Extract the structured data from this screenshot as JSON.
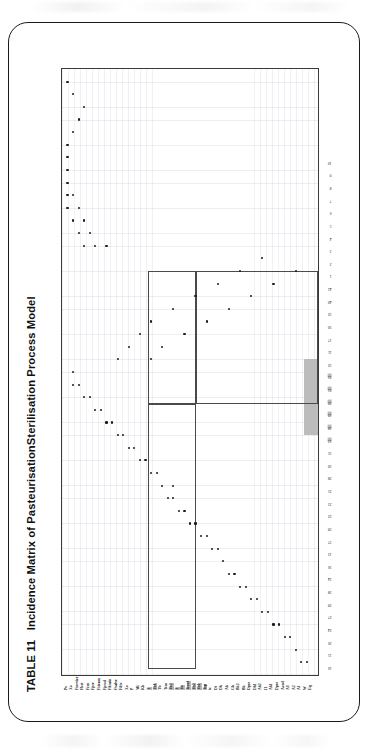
{
  "page": {
    "background": "#ffffff",
    "card_border_color": "#1a1a1a"
  },
  "caption": {
    "table_number": "TABLE 11",
    "title": "Incidence Matrix of PasteurisationSterilisation Process Model",
    "full": "TABLE 11  Incidence Matrix of PasteurisationSterilisation Process Model"
  },
  "highlight": {
    "color": "#b9b9b9",
    "row_label_range": [
      "Tsp",
      "Tb1",
      "Tb2",
      "Tcool",
      "Th",
      "T",
      "Th2"
    ],
    "col_label_range": [
      "18",
      "19",
      "20",
      "21",
      "31",
      "32"
    ]
  },
  "chart_data": {
    "type": "scatter",
    "title": "Incidence Matrix of PasteurisationSterilisation Process Model",
    "subtitle": "",
    "xlabel": "",
    "ylabel": "",
    "grid": true,
    "legend": "none",
    "orientation": "rotated-90-ccw",
    "xlim": [
      0,
      48
    ],
    "ylim": [
      0,
      46
    ],
    "x_tick_labels": [
      "16",
      "15",
      "26",
      "24",
      "27",
      "29",
      "38",
      "34",
      "36",
      "12",
      "37",
      "39",
      "22",
      "23",
      "25",
      "28",
      "30",
      "35",
      "13",
      "18",
      "19",
      "20",
      "21",
      "31",
      "32",
      "11",
      "17",
      "30",
      "32",
      "40",
      "41",
      "1",
      "2",
      "3",
      "4",
      "5",
      "6",
      "7",
      "8",
      "9",
      "10"
    ],
    "y_tick_labels": [
      "Eq",
      "W",
      "A1",
      "A2",
      "A3",
      "Acool",
      "Dpre",
      "Ah1",
      "I1",
      "Ah2",
      "Dh1",
      "Dpre",
      "Bh",
      "Bh2",
      "Gh",
      "Ah",
      "Dh",
      "Dt",
      "tc",
      "Tsp",
      "Tb1",
      "Tb2",
      "Tcool",
      "Th",
      "T",
      "Th2",
      "Tcm",
      "Tb",
      "Tb1",
      "T",
      "Kh",
      "Mi",
      "P",
      "Xo",
      "Fdiv",
      "Fvalve",
      "Fdrain",
      "Fprod",
      "Fsteam",
      "Fpre",
      "Fcm",
      "Fhot",
      "Fservice",
      "Xo",
      "Po"
    ],
    "points": [
      [
        1,
        2
      ],
      [
        1,
        3
      ],
      [
        2,
        4
      ],
      [
        3,
        5
      ],
      [
        3,
        6
      ],
      [
        4,
        7
      ],
      [
        4,
        8
      ],
      [
        5,
        9
      ],
      [
        5,
        10
      ],
      [
        6,
        11
      ],
      [
        6,
        12
      ],
      [
        7,
        13
      ],
      [
        7,
        14
      ],
      [
        8,
        15
      ],
      [
        8,
        16
      ],
      [
        9,
        17
      ],
      [
        10,
        18
      ],
      [
        10,
        19
      ],
      [
        11,
        20
      ],
      [
        11,
        21
      ],
      [
        12,
        22
      ],
      [
        12,
        23
      ],
      [
        13,
        24
      ],
      [
        13,
        25
      ],
      [
        14,
        26
      ],
      [
        14,
        27
      ],
      [
        15,
        26
      ],
      [
        15,
        28
      ],
      [
        16,
        29
      ],
      [
        16,
        30
      ],
      [
        17,
        31
      ],
      [
        17,
        32
      ],
      [
        18,
        33
      ],
      [
        18,
        34
      ],
      [
        19,
        35
      ],
      [
        19,
        36
      ],
      [
        20,
        37
      ],
      [
        20,
        38
      ],
      [
        21,
        39
      ],
      [
        21,
        40
      ],
      [
        22,
        41
      ],
      [
        22,
        42
      ],
      [
        23,
        43
      ],
      [
        23,
        44
      ],
      [
        24,
        44
      ],
      [
        25,
        30
      ],
      [
        25,
        36
      ],
      [
        26,
        28
      ],
      [
        26,
        34
      ],
      [
        27,
        24
      ],
      [
        27,
        32
      ],
      [
        28,
        20
      ],
      [
        28,
        30
      ],
      [
        29,
        16
      ],
      [
        29,
        26
      ],
      [
        30,
        12
      ],
      [
        30,
        22
      ],
      [
        31,
        8
      ],
      [
        31,
        18
      ],
      [
        32,
        4
      ],
      [
        32,
        14
      ],
      [
        33,
        10
      ],
      [
        34,
        38
      ],
      [
        34,
        40
      ],
      [
        34,
        42
      ],
      [
        35,
        41
      ],
      [
        35,
        43
      ],
      [
        36,
        42
      ],
      [
        36,
        44
      ],
      [
        37,
        43
      ],
      [
        37,
        45
      ],
      [
        38,
        44
      ],
      [
        38,
        45
      ],
      [
        39,
        45
      ],
      [
        40,
        45
      ],
      [
        41,
        45
      ],
      [
        42,
        45
      ],
      [
        43,
        44
      ],
      [
        44,
        43
      ],
      [
        45,
        42
      ],
      [
        46,
        44
      ],
      [
        47,
        45
      ]
    ],
    "boxes": [
      {
        "name": "block-upper-left",
        "x": 0.5,
        "y": 22.0,
        "w": 21.0,
        "h": 8.5
      },
      {
        "name": "block-upper-right",
        "x": 21.5,
        "y": 22.0,
        "w": 10.5,
        "h": 8.5
      },
      {
        "name": "block-lower-band",
        "x": 21.5,
        "y": 0.0,
        "w": 10.5,
        "h": 22.0
      }
    ]
  }
}
